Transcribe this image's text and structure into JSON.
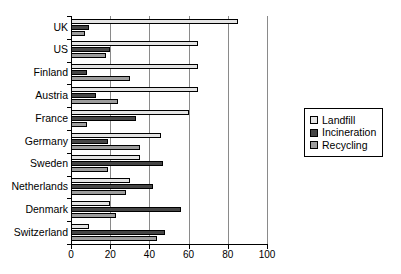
{
  "chart_data": {
    "type": "bar",
    "orientation": "horizontal",
    "title": "",
    "xlabel": "",
    "ylabel": "",
    "xlim": [
      0,
      100
    ],
    "xticks": [
      0,
      20,
      40,
      60,
      80,
      100
    ],
    "grid": true,
    "legend_position": "right",
    "categories": [
      "UK",
      "US",
      "Finland",
      "Austria",
      "France",
      "Germany",
      "Sweden",
      "Netherlands",
      "Denmark",
      "Switzerland"
    ],
    "series": [
      {
        "name": "Landfill",
        "color": "#e4e4e4",
        "values": [
          85,
          65,
          65,
          65,
          60,
          46,
          35,
          30,
          20,
          9
        ]
      },
      {
        "name": "Incineration",
        "color": "#454545",
        "values": [
          9,
          20,
          8,
          13,
          33,
          19,
          47,
          42,
          56,
          48
        ]
      },
      {
        "name": "Recycling",
        "color": "#9d9d9d",
        "values": [
          7,
          18,
          30,
          24,
          8,
          35,
          19,
          28,
          23,
          44
        ]
      }
    ]
  },
  "legend": {
    "items": [
      {
        "label": "Landfill"
      },
      {
        "label": "Incineration"
      },
      {
        "label": "Recycling"
      }
    ]
  },
  "caption": ""
}
